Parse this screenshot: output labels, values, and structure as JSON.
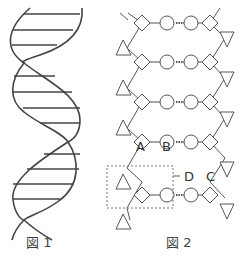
{
  "figure1": {
    "caption": "図 1",
    "description": "DNA double helix with horizontal base-pair rungs"
  },
  "figure2": {
    "caption": "図 2",
    "labels": {
      "A": "A",
      "B": "B",
      "C": "C",
      "D": "D"
    },
    "legend_shapes": {
      "diamond": "sugar",
      "circle": "base",
      "triangle": "phosphate",
      "dotted_line": "hydrogen bond",
      "dashed_box": "nucleotide (D)"
    },
    "rows": 5
  },
  "colors": {
    "stroke": "#444444",
    "background": "#ffffff"
  }
}
